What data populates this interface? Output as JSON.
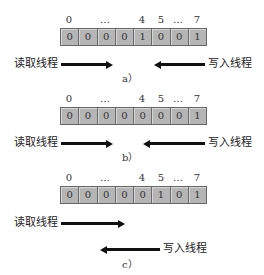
{
  "index_labels": [
    "0",
    "…",
    "4",
    "5",
    "…",
    "7"
  ],
  "thread_labels": {
    "read": "读取线程",
    "write": "写入线程"
  },
  "panels": [
    {
      "caption": "a）",
      "bits": [
        "0",
        "0",
        "0",
        "0",
        "1",
        "0",
        "0",
        "1"
      ]
    },
    {
      "caption": "b）",
      "bits": [
        "0",
        "0",
        "0",
        "0",
        "0",
        "0",
        "0",
        "1"
      ]
    },
    {
      "caption": "c）",
      "bits": [
        "0",
        "0",
        "0",
        "0",
        "0",
        "1",
        "0",
        "1"
      ]
    }
  ],
  "colors": {
    "cell_fill": "#b5b5b5",
    "arrow": "#111111"
  }
}
